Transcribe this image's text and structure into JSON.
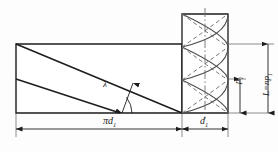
{
  "diagram": {
    "labels": {
      "pitch_circumference": "πd",
      "pitch_circumference_sub": "1",
      "minor_diameter": "d",
      "minor_diameter_sub": "1",
      "lead_angle": "λ",
      "pitch": "p",
      "pitch_sub": "1",
      "lead": "L=np",
      "lead_sub": "1"
    },
    "colors": {
      "line": "#1c1c1c",
      "centerline": "#6d6d6d",
      "helix": "#4d4d4d",
      "background": "#fdfdfd"
    },
    "geometry": {
      "dev_left": 16,
      "dev_right": 182,
      "dev_top": 44,
      "dev_bottom": 113,
      "dev_mid": 79,
      "cyl_left": 182,
      "cyl_right": 228,
      "cyl_top": 14,
      "cyl_bottom": 113,
      "dim_baseline_y": 129,
      "dim_lead_x": 268,
      "dim_pitch_x": 240
    }
  }
}
